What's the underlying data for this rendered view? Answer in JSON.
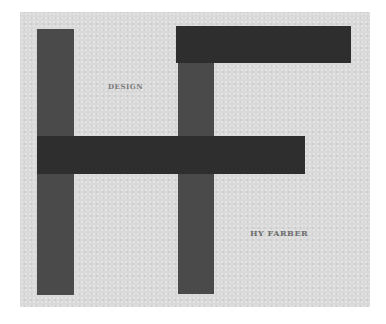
{
  "artwork": {
    "type": "monogram cover",
    "monogram": "HF",
    "texts": {
      "top_label": "DESIGN",
      "bottom_label": "HY FARBER"
    },
    "colors": {
      "background": "#ffffff",
      "paper": "#d9d9d9",
      "vertical_bars": "#4a4a4a",
      "horizontal_bars": "#2e2e2e",
      "text": "#7a7a7a"
    },
    "shapes": [
      {
        "name": "left-vertical-bar",
        "x": 37,
        "y": 29,
        "w": 37,
        "h": 266
      },
      {
        "name": "middle-vertical-bar",
        "x": 178,
        "y": 62,
        "w": 36,
        "h": 232
      },
      {
        "name": "top-horizontal-bar",
        "x": 176,
        "y": 26,
        "w": 175,
        "h": 37
      },
      {
        "name": "middle-horizontal-bar",
        "x": 37,
        "y": 136,
        "w": 268,
        "h": 38
      }
    ]
  }
}
